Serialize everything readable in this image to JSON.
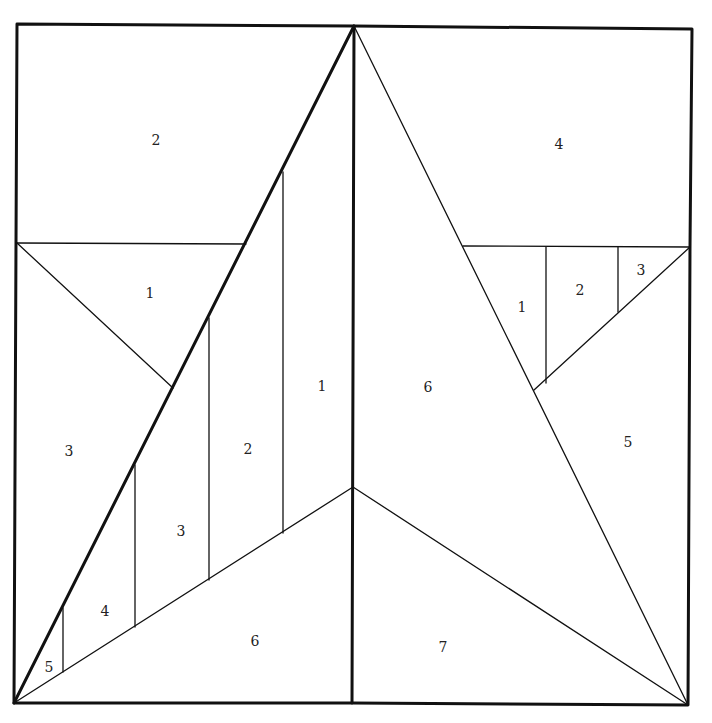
{
  "diagram": {
    "type": "paper-piecing quilt block pattern",
    "colors": {
      "line": "#111111",
      "background": "#ffffff",
      "label": "#222222"
    },
    "left_half": {
      "labels": [
        {
          "id": "L2-top",
          "text": "2",
          "x": 156,
          "y": 141
        },
        {
          "id": "L1-triangle",
          "text": "1",
          "x": 150,
          "y": 294
        },
        {
          "id": "L3-side",
          "text": "3",
          "x": 69,
          "y": 452
        },
        {
          "id": "L1-strip",
          "text": "1",
          "x": 322,
          "y": 387
        },
        {
          "id": "L2-strip",
          "text": "2",
          "x": 248,
          "y": 450
        },
        {
          "id": "L3-strip",
          "text": "3",
          "x": 181,
          "y": 532
        },
        {
          "id": "L4-strip",
          "text": "4",
          "x": 105,
          "y": 612
        },
        {
          "id": "L5-corner",
          "text": "5",
          "x": 49,
          "y": 668
        },
        {
          "id": "L6-bottom",
          "text": "6",
          "x": 255,
          "y": 642
        }
      ]
    },
    "right_half": {
      "labels": [
        {
          "id": "R4-top",
          "text": "4",
          "x": 559,
          "y": 145
        },
        {
          "id": "R1-small",
          "text": "1",
          "x": 522,
          "y": 308
        },
        {
          "id": "R2-small",
          "text": "2",
          "x": 580,
          "y": 291
        },
        {
          "id": "R3-small",
          "text": "3",
          "x": 641,
          "y": 271
        },
        {
          "id": "R6-star",
          "text": "6",
          "x": 428,
          "y": 388
        },
        {
          "id": "R5-side",
          "text": "5",
          "x": 628,
          "y": 443
        },
        {
          "id": "R7-bottom",
          "text": "7",
          "x": 443,
          "y": 648
        }
      ]
    }
  }
}
